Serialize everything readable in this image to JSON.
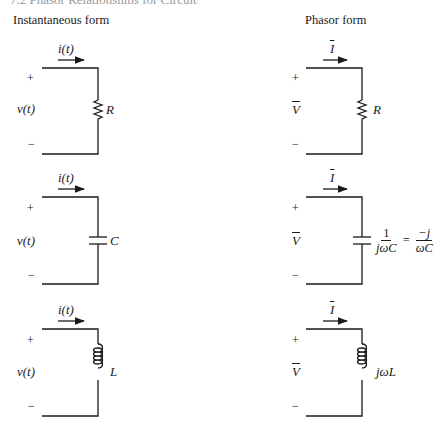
{
  "page_header_cut": "7.2 Phasor Relationships for Circuit Elements",
  "columns": {
    "left_title": "Instantaneous form",
    "right_title": "Phasor form"
  },
  "instantaneous": {
    "current_label": "i(t)",
    "voltage_label": "v(t)",
    "plus": "+",
    "minus": "−",
    "elements": [
      {
        "type": "resistor",
        "label": "R"
      },
      {
        "type": "capacitor",
        "label": "C"
      },
      {
        "type": "inductor",
        "label": "L"
      }
    ]
  },
  "phasor": {
    "current_label": "I",
    "voltage_label": "V",
    "plus": "+",
    "minus": "−",
    "elements": [
      {
        "type": "resistor",
        "label": "R"
      },
      {
        "type": "capacitor",
        "num1": "1",
        "den1": "jωC",
        "equals": "=",
        "num2": "−j",
        "den2": "ωC"
      },
      {
        "type": "inductor",
        "label": "jωL"
      }
    ]
  }
}
